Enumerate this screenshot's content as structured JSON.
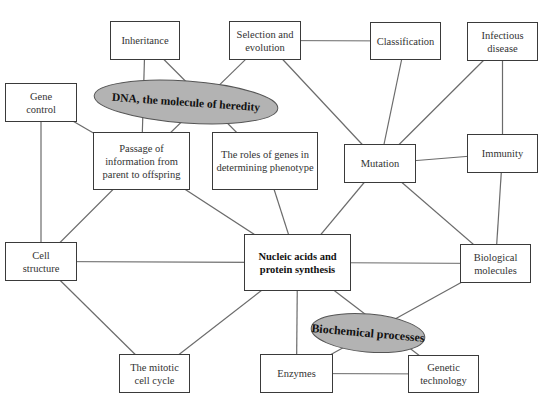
{
  "diagram": {
    "type": "concept-map",
    "colors": {
      "line": "#6b6b6b",
      "box_border": "#3a3a3a",
      "ellipse_fill": "#b3b3b3",
      "ellipse_border": "#555555",
      "background": "#ffffff"
    },
    "nodes": {
      "inheritance": {
        "label": "Inheritance",
        "x": 110,
        "y": 21,
        "w": 70,
        "h": 39
      },
      "selection": {
        "label": "Selection and evolution",
        "x": 229,
        "y": 21,
        "w": 72,
        "h": 39
      },
      "classification": {
        "label": "Classification",
        "x": 370,
        "y": 22,
        "w": 71,
        "h": 38
      },
      "infectious": {
        "label": "Infectious disease",
        "x": 467,
        "y": 22,
        "w": 71,
        "h": 39
      },
      "gene_control": {
        "label": "Gene control",
        "x": 5,
        "y": 83,
        "w": 72,
        "h": 39
      },
      "passage": {
        "label": "Passage of information from parent to offspring",
        "x": 93,
        "y": 132,
        "w": 97,
        "h": 58
      },
      "roles": {
        "label": "The roles of genes in determining phenotype",
        "x": 212,
        "y": 132,
        "w": 106,
        "h": 58
      },
      "mutation": {
        "label": "Mutation",
        "x": 344,
        "y": 144,
        "w": 72,
        "h": 39
      },
      "immunity": {
        "label": "Immunity",
        "x": 467,
        "y": 134,
        "w": 71,
        "h": 39
      },
      "cell_structure": {
        "label": "Cell structure",
        "x": 5,
        "y": 242,
        "w": 72,
        "h": 39
      },
      "nucleic": {
        "label": "Nucleic acids and protein synthesis",
        "x": 244,
        "y": 234,
        "w": 107,
        "h": 57
      },
      "bio_molecules": {
        "label": "Biological molecules",
        "x": 460,
        "y": 244,
        "w": 71,
        "h": 39
      },
      "mitotic": {
        "label": "The mitotic cell cycle",
        "x": 119,
        "y": 354,
        "w": 71,
        "h": 39
      },
      "enzymes": {
        "label": "Enzymes",
        "x": 260,
        "y": 354,
        "w": 73,
        "h": 39
      },
      "genetic_tech": {
        "label": "Genetic technology",
        "x": 408,
        "y": 355,
        "w": 71,
        "h": 38
      }
    },
    "ellipses": {
      "dna": {
        "label": "DNA, the molecule of heredity",
        "cx": 186,
        "cy": 102,
        "rx": 92,
        "ry": 21,
        "rotate": 4
      },
      "biochem": {
        "label": "Biochemical processes",
        "cx": 368,
        "cy": 333,
        "rx": 57,
        "ry": 19,
        "rotate": 5
      }
    },
    "edges": [
      [
        "inheritance",
        "passage"
      ],
      [
        "inheritance",
        "roles"
      ],
      [
        "selection",
        "passage"
      ],
      [
        "selection",
        "classification"
      ],
      [
        "selection",
        "mutation"
      ],
      [
        "classification",
        "mutation"
      ],
      [
        "infectious",
        "mutation"
      ],
      [
        "infectious",
        "immunity"
      ],
      [
        "gene_control",
        "passage"
      ],
      [
        "gene_control",
        "cell_structure"
      ],
      [
        "passage",
        "cell_structure"
      ],
      [
        "passage",
        "nucleic"
      ],
      [
        "roles",
        "nucleic"
      ],
      [
        "mutation",
        "immunity"
      ],
      [
        "mutation",
        "nucleic"
      ],
      [
        "mutation",
        "bio_molecules"
      ],
      [
        "immunity",
        "bio_molecules"
      ],
      [
        "cell_structure",
        "nucleic"
      ],
      [
        "cell_structure",
        "mitotic"
      ],
      [
        "nucleic",
        "mitotic"
      ],
      [
        "nucleic",
        "bio_molecules"
      ],
      [
        "nucleic",
        "enzymes"
      ],
      [
        "nucleic",
        "genetic_tech"
      ],
      [
        "bio_molecules",
        "enzymes"
      ],
      [
        "enzymes",
        "genetic_tech"
      ]
    ]
  }
}
